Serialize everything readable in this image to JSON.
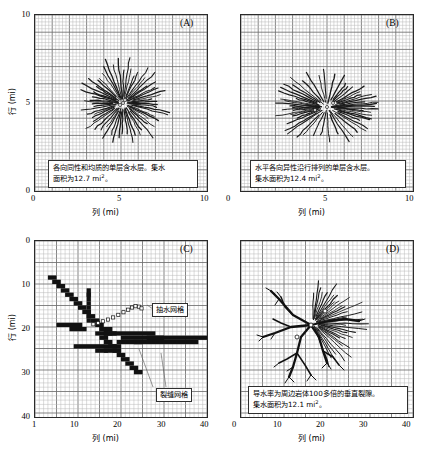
{
  "figure": {
    "axis_titles": {
      "x": "列 (mi)",
      "y": "行 (mi)"
    },
    "panels": [
      {
        "id": "A",
        "letter": "(A)",
        "caption_line1": "各向同性和均质的单层含水层。集水",
        "caption_line2_pre": "面积为12.7 mi",
        "caption_sup": "2",
        "caption_line2_post": "。",
        "xticks": [
          "0",
          "5",
          "10"
        ],
        "yticks": [
          "10",
          "5",
          "0"
        ]
      },
      {
        "id": "B",
        "letter": "(B)",
        "caption_line1": "水平各向异性沿行排列的单层含水层。",
        "caption_line2_pre": "集水面积为12.4 mi",
        "caption_sup": "2",
        "caption_line2_post": "。",
        "xticks": [
          "0",
          "5",
          "10"
        ],
        "yticks": [
          "10",
          "5",
          "0"
        ]
      },
      {
        "id": "C",
        "letter": "(C)",
        "callouts": [
          {
            "name": "pumping-grid",
            "label": "抽水网格"
          },
          {
            "name": "fracture-grid",
            "label": "裂缝网格"
          }
        ],
        "xticks": [
          "1",
          "10",
          "20",
          "30",
          "40"
        ],
        "yticks": [
          "0",
          "10",
          "20",
          "30",
          "40"
        ]
      },
      {
        "id": "D",
        "letter": "(D)",
        "caption_line1": "导水率为周边岩体100多倍的垂直裂隙。",
        "caption_line2_pre": "集水面积为12.1 mi",
        "caption_sup": "2",
        "caption_line2_post": "。",
        "xticks": [
          "0",
          "10",
          "20",
          "30",
          "40"
        ],
        "yticks": [
          "0",
          "10",
          "20",
          "30",
          "40"
        ]
      }
    ]
  },
  "chart_data": {
    "type": "scatter",
    "xlabel": "列 (mi)",
    "ylabel": "行 (mi)",
    "grid": true,
    "legend": "none",
    "panels": [
      {
        "id": "A",
        "label": "(A)",
        "description": "各向同性和均质的单层含水层",
        "capture_area_mi2": 12.7,
        "xlim": [
          0,
          10
        ],
        "ylim": [
          0,
          10
        ],
        "xticks": [
          0,
          5,
          10
        ],
        "yticks": [
          0,
          5,
          10
        ],
        "y_axis_inverted": false,
        "well": [
          5.0,
          5.0
        ],
        "pattern": "radial",
        "n_pathlines": 60
      },
      {
        "id": "B",
        "label": "(B)",
        "description": "水平各向异性沿行排列的单层含水层",
        "capture_area_mi2": 12.4,
        "xlim": [
          0,
          10
        ],
        "ylim": [
          0,
          10
        ],
        "xticks": [
          0,
          5,
          10
        ],
        "yticks": [
          0,
          5,
          10
        ],
        "y_axis_inverted": false,
        "well": [
          5.0,
          5.0
        ],
        "pattern": "radial-elongated-row-aligned",
        "n_pathlines": 54
      },
      {
        "id": "C",
        "label": "(C)",
        "description": "裂缝网格与抽水网格分布图",
        "xlim": [
          1,
          40
        ],
        "ylim": [
          0,
          40
        ],
        "xticks": [
          1,
          10,
          20,
          30,
          40
        ],
        "yticks": [
          0,
          10,
          20,
          30,
          40
        ],
        "y_axis_inverted": true,
        "annotations": [
          "抽水网格",
          "裂缝网格"
        ],
        "fracture_cells": "stair-step black cells",
        "pumping_cells": "open square markers"
      },
      {
        "id": "D",
        "label": "(D)",
        "description": "导水率为周边岩体100多倍的垂直裂隙",
        "capture_area_mi2": 12.1,
        "xlim": [
          0,
          40
        ],
        "ylim": [
          0,
          40
        ],
        "xticks": [
          0,
          10,
          20,
          30,
          40
        ],
        "yticks": [
          0,
          10,
          20,
          30,
          40
        ],
        "y_axis_inverted": true,
        "well": [
          17.0,
          24.0
        ],
        "pattern": "branching-fracture-with-radial-capture"
      }
    ]
  }
}
